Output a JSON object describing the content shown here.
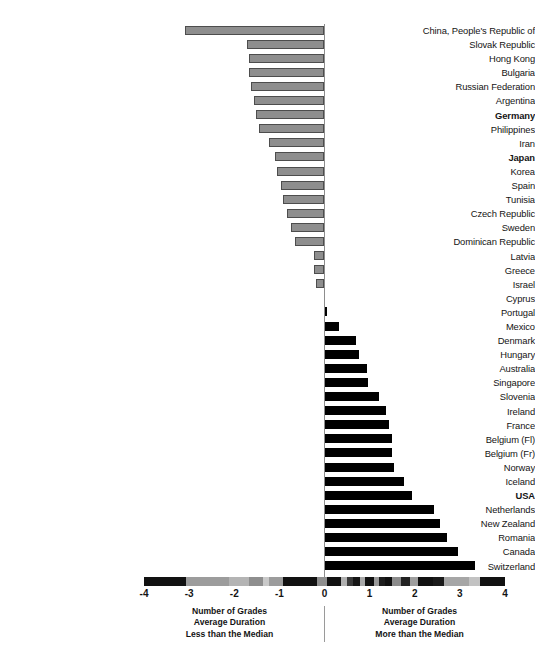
{
  "chart_data": {
    "type": "bar",
    "orientation": "horizontal",
    "title": "",
    "subtitle": "",
    "xlabel": "",
    "ylabel": "",
    "xlim": [
      -4,
      4
    ],
    "xticks": [
      "-4",
      "-3",
      "-2",
      "-1",
      "0",
      "1",
      "2",
      "3",
      "4"
    ],
    "xtick_values": [
      -4,
      -3,
      -2,
      -1,
      0,
      1,
      2,
      3,
      4
    ],
    "grid": false,
    "legend": "none",
    "zero_reference": 0,
    "categories": [
      "China, People's Republic of",
      "Slovak Republic",
      "Hong Kong",
      "Bulgaria",
      "Russian Federation",
      "Argentina",
      "Germany",
      "Philippines",
      "Iran",
      "Japan",
      "Korea",
      "Spain",
      "Tunisia",
      "Czech Republic",
      "Sweden",
      "Dominican Republic",
      "Latvia",
      "Greece",
      "Israel",
      "Cyprus",
      "Portugal",
      "Mexico",
      "Denmark",
      "Hungary",
      "Australia",
      "Singapore",
      "Slovenia",
      "Ireland",
      "France",
      "Belgium (Fl)",
      "Belgium (Fr)",
      "Norway",
      "Iceland",
      "USA",
      "Netherlands",
      "New Zealand",
      "Romania",
      "Canada",
      "Switzerland"
    ],
    "values": [
      -3.1,
      -1.72,
      -1.68,
      -1.68,
      -1.63,
      -1.56,
      -1.52,
      -1.45,
      -1.23,
      -1.1,
      -1.05,
      -0.96,
      -0.92,
      -0.83,
      -0.74,
      -0.65,
      -0.23,
      -0.23,
      -0.19,
      0.0,
      0.06,
      0.33,
      0.7,
      0.76,
      0.95,
      0.97,
      1.2,
      1.36,
      1.42,
      1.5,
      1.5,
      1.53,
      1.77,
      1.95,
      2.43,
      2.55,
      2.72,
      2.95,
      3.33
    ],
    "emphasized_categories": [
      "Germany",
      "Japan",
      "USA"
    ],
    "series_colors": {
      "negative": "#8e8e8e",
      "negative_border": "#4d4d4d",
      "positive": "#000000"
    },
    "annotations": {
      "left_caption_lines": [
        "Number of Grades",
        "Average Duration",
        "Less than the Median"
      ],
      "right_caption_lines": [
        "Number of Grades",
        "Average Duration",
        "More than the Median"
      ]
    }
  }
}
